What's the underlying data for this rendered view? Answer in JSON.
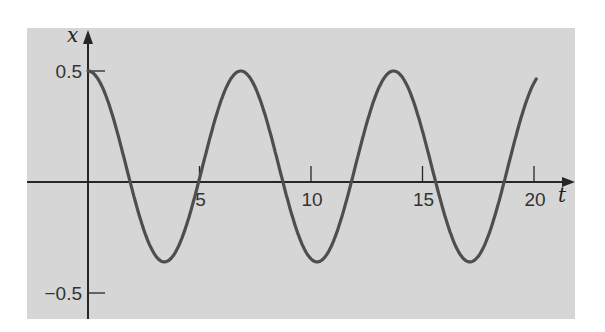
{
  "chart_data": {
    "type": "line",
    "title": "",
    "xlabel": "t",
    "ylabel": "x",
    "xlim": [
      0,
      20.1
    ],
    "ylim": [
      -0.62,
      0.62
    ],
    "grid": false,
    "legend": null,
    "x_ticks": [
      5,
      10,
      15,
      20
    ],
    "x_tick_labels": [
      "5",
      "10",
      "15",
      "20"
    ],
    "y_ticks": [
      0.5,
      -0.5
    ],
    "y_tick_labels": [
      "0.5",
      "−0.5"
    ],
    "series": [
      {
        "name": "x(t)",
        "description": "oscillation starting at 0.5, peaks at 0.5, troughs near -0.36, period about 6.85",
        "x": [
          0,
          1,
          2,
          3,
          3.43,
          4,
          5,
          6,
          6.85,
          7,
          8,
          9,
          10,
          10.28,
          11,
          12,
          13,
          13.7,
          14,
          15,
          16,
          17,
          17.13,
          18,
          19,
          20,
          20.1
        ],
        "y": [
          0.5,
          0.34,
          -0.03,
          -0.32,
          -0.36,
          -0.33,
          -0.05,
          0.31,
          0.5,
          0.5,
          0.37,
          0.02,
          -0.34,
          -0.36,
          -0.28,
          0.06,
          0.41,
          0.5,
          0.49,
          0.29,
          -0.1,
          -0.36,
          -0.36,
          -0.26,
          0.1,
          0.43,
          0.45
        ]
      }
    ],
    "colors": {
      "background": "#d6d6d6",
      "curve": "#4e4e4e",
      "axes": "#262626"
    }
  }
}
